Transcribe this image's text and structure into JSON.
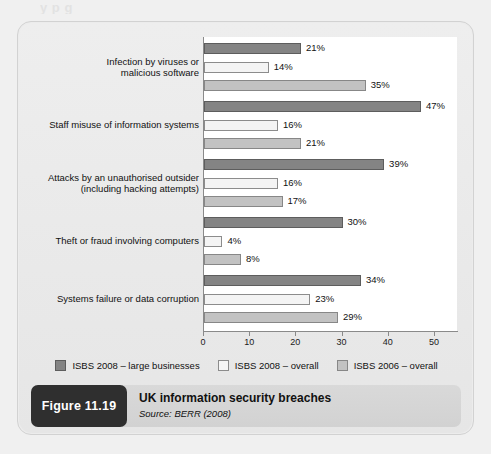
{
  "top_cut_text": "y p g",
  "chart_data": {
    "type": "bar",
    "orientation": "horizontal",
    "title": "UK information security breaches",
    "source": "Source: BERR (2008)",
    "figure_number": "Figure 11.19",
    "xlabel": "",
    "ylabel": "",
    "xlim": [
      0,
      55
    ],
    "xticks": [
      0,
      10,
      20,
      30,
      40,
      50
    ],
    "xtick_labels": [
      "0",
      "10",
      "20",
      "30",
      "40",
      "50"
    ],
    "grid": false,
    "legend_position": "bottom",
    "value_suffix": "%",
    "categories": [
      "Infection by viruses or malicious software",
      "Staff misuse of information systems",
      "Attacks by an unauthorised outsider (including hacking attempts)",
      "Theft or fraud involving computers",
      "Systems failure or data corruption"
    ],
    "category_lines": [
      [
        "Infection by viruses or",
        "malicious software"
      ],
      [
        "Staff misuse of information systems"
      ],
      [
        "Attacks by an unauthorised outsider",
        "(including hacking attempts)"
      ],
      [
        "Theft or fraud involving computers"
      ],
      [
        "Systems failure or data corruption"
      ]
    ],
    "series": [
      {
        "name": "ISBS 2008 – large businesses",
        "color": "#848484",
        "values": [
          21,
          47,
          39,
          30,
          34
        ],
        "labels": [
          "21%",
          "47%",
          "39%",
          "30%",
          "34%"
        ]
      },
      {
        "name": "ISBS 2008 – overall",
        "color": "#f4f4f4",
        "values": [
          14,
          16,
          16,
          4,
          23
        ],
        "labels": [
          "14%",
          "16%",
          "16%",
          "4%",
          "23%"
        ]
      },
      {
        "name": "ISBS 2006 – overall",
        "color": "#c2c2c2",
        "values": [
          35,
          21,
          17,
          8,
          29
        ],
        "labels": [
          "35%",
          "21%",
          "17%",
          "8%",
          "29%"
        ]
      }
    ]
  },
  "caption": {
    "badge": "Figure 11.19",
    "title": "UK information security breaches",
    "source": "Source: BERR (2008)"
  }
}
